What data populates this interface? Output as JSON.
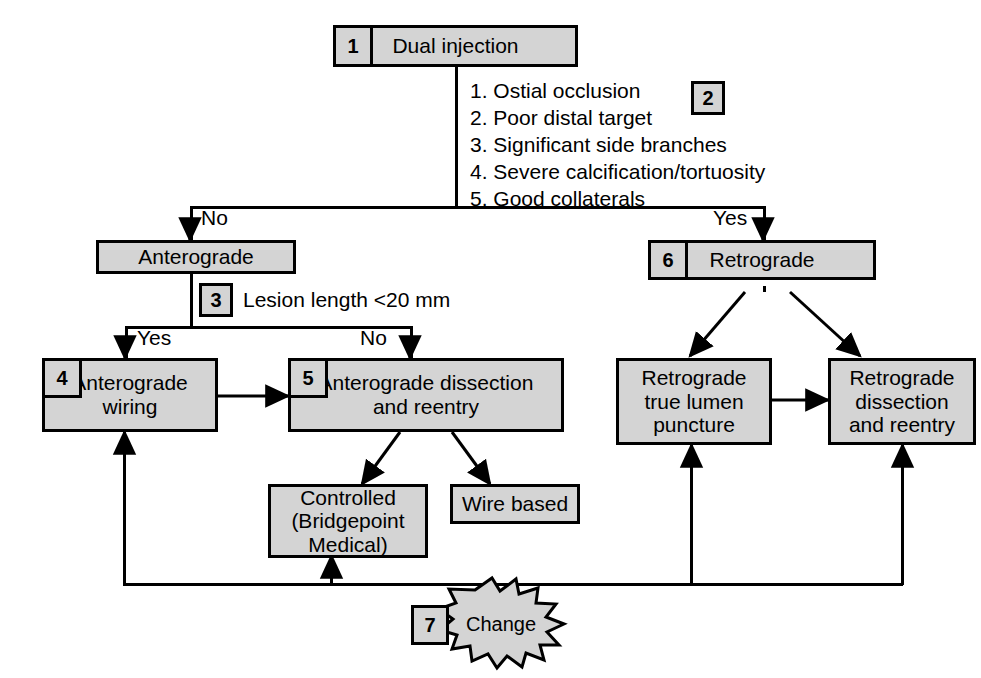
{
  "diagram": {
    "colors": {
      "node_fill": "#d4d4d4",
      "outline": "#000000",
      "background": "#ffffff",
      "burst_fill": "#d4d4d4"
    },
    "nodes": {
      "dual_injection": {
        "tag": "1",
        "label": "Dual injection"
      },
      "criteria": {
        "tag": "2",
        "items": [
          "1. Ostial occlusion",
          "2. Poor distal target",
          "3. Significant side branches",
          "4. Severe calcification/tortuosity",
          "5. Good collaterals"
        ]
      },
      "anterograde": {
        "label": "Anterograde"
      },
      "lesion_length": {
        "tag": "3",
        "label": "Lesion length <20 mm"
      },
      "anterograde_wiring": {
        "tag": "4",
        "label": "Anterograde\nwiring"
      },
      "anterograde_dissection": {
        "tag": "5",
        "label": "Anterograde dissection\nand reentry"
      },
      "controlled": {
        "label": "Controlled\n(Bridgepoint\nMedical)"
      },
      "wire_based": {
        "label": "Wire based"
      },
      "retrograde": {
        "tag": "6",
        "label": "Retrograde"
      },
      "retrograde_true_lumen": {
        "label": "Retrograde\ntrue lumen\npuncture"
      },
      "retrograde_dissection": {
        "label": "Retrograde\ndissection\nand reentry"
      },
      "change": {
        "tag": "7",
        "label": "Change"
      }
    },
    "edge_labels": {
      "branch_no": "No",
      "branch_yes": "Yes",
      "lesion_yes": "Yes",
      "lesion_no": "No"
    }
  }
}
